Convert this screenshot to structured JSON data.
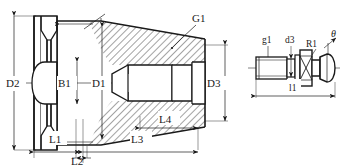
{
  "drawing": {
    "title": "Tool holder taper shank and pull stud technical drawing",
    "line_color": "#1a1a1a",
    "hatch_color": "#1a1a1a",
    "background": "#ffffff"
  },
  "left_view": {
    "name": "taper-shank-section-view",
    "labels": {
      "d2": "D2",
      "b1": "B1",
      "d1": "D1",
      "g1": "G1",
      "d3": "D3",
      "l1": "L1",
      "l2": "L2",
      "l3": "L3",
      "l4": "L4"
    }
  },
  "right_view": {
    "name": "pull-stud-detail-view",
    "labels": {
      "g1_small": "g1",
      "d3_small": "d3",
      "r1": "R1",
      "theta": "θ",
      "l1_small": "l1"
    }
  }
}
